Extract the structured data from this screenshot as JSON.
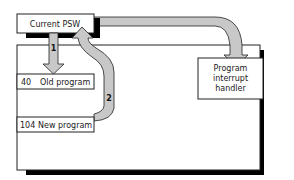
{
  "diagram": {
    "psw_box": {
      "label": "Current PSW"
    },
    "memory": {
      "rows": [
        {
          "address": "40",
          "label": "Old program"
        },
        {
          "address": "104",
          "label": "New program"
        }
      ]
    },
    "handler_box": {
      "lines": [
        "Program",
        "interrupt",
        "handler"
      ]
    },
    "arrows": [
      {
        "id": "1",
        "label": "1",
        "from": "Current PSW",
        "to": "Old program"
      },
      {
        "id": "2",
        "label": "2",
        "from": "New program",
        "to": "Current PSW"
      },
      {
        "id": "3",
        "label": "",
        "from": "Current PSW",
        "to": "Program interrupt handler"
      }
    ],
    "colors": {
      "arrow_fill": "#c8c8c8",
      "stroke": "#222222",
      "shadow": "#000000",
      "box_fill": "#ffffff"
    }
  }
}
